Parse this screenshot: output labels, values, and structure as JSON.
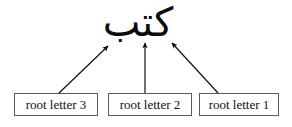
{
  "diagram": {
    "background_color": "#ffffff",
    "ink_color": "#0c0c0c",
    "box_border_color": "#5c5c5c",
    "word": {
      "text": "كتب",
      "transliteration": "k-t-b",
      "direction": "rtl"
    },
    "boxes": [
      {
        "id": "root-letter-3",
        "label": "root letter 3"
      },
      {
        "id": "root-letter-2",
        "label": "root letter 2"
      },
      {
        "id": "root-letter-1",
        "label": "root letter 1"
      }
    ],
    "arrows": [
      {
        "id": "arrow-to-root-letter-3",
        "from_box": "root-letter-3",
        "direction": "up-right",
        "tail": [
          58,
          94
        ],
        "head": [
          108,
          45
        ]
      },
      {
        "id": "arrow-to-root-letter-2",
        "from_box": "root-letter-2",
        "direction": "up",
        "tail": [
          145,
          93
        ],
        "head": [
          145,
          42
        ]
      },
      {
        "id": "arrow-to-root-letter-1",
        "from_box": "root-letter-1",
        "direction": "up-left",
        "tail": [
          218,
          93
        ],
        "head": [
          171,
          42
        ]
      }
    ]
  }
}
